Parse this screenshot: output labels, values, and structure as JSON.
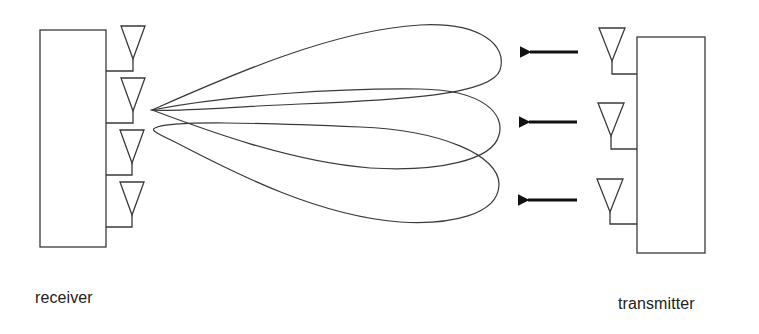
{
  "diagram": {
    "type": "beamforming-link",
    "stroke_color": "#3a3a3a",
    "arrow_color": "#111111",
    "receiver": {
      "label": "receiver",
      "box": {
        "x": 40,
        "y": 30,
        "w": 66,
        "h": 217
      },
      "antenna_count": 4,
      "antennas": [
        {
          "top": 26,
          "feed_y": 71
        },
        {
          "top": 78,
          "feed_y": 123
        },
        {
          "top": 130,
          "feed_y": 175
        },
        {
          "top": 182,
          "feed_y": 227
        }
      ]
    },
    "transmitter": {
      "label": "transmitter",
      "box": {
        "x": 637,
        "y": 37,
        "w": 68,
        "h": 216
      },
      "antenna_count": 3,
      "antennas": [
        {
          "top": 28,
          "feed_y": 74
        },
        {
          "top": 103,
          "feed_y": 149
        },
        {
          "top": 179,
          "feed_y": 224
        }
      ]
    },
    "beams": {
      "count": 3,
      "origin": {
        "x": 152,
        "y": 110
      },
      "lobes": [
        "upper",
        "middle",
        "lower"
      ]
    },
    "arrows": {
      "count": 3,
      "direction": "left",
      "y": [
        52,
        122,
        200
      ]
    }
  }
}
